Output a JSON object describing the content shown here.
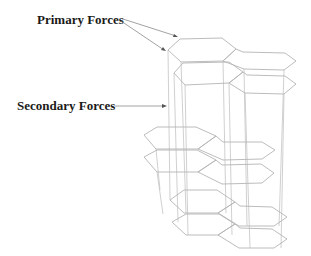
{
  "diagram": {
    "labels": {
      "primary": "Primary Forces",
      "secondary": "Secondary Forces"
    },
    "structure": {
      "layers": 3,
      "sheets_per_layer": 2,
      "hexagons_per_sheet": 2,
      "description": "Three stacked pairs of hexagonal sheets connected by vertical pillars"
    },
    "colors": {
      "label_text": "#1a1a1a",
      "hexagon_stroke": "#b4b4b4",
      "pillar_stroke": "#c4c4c4",
      "leader_line": "#8a8a8a"
    }
  }
}
